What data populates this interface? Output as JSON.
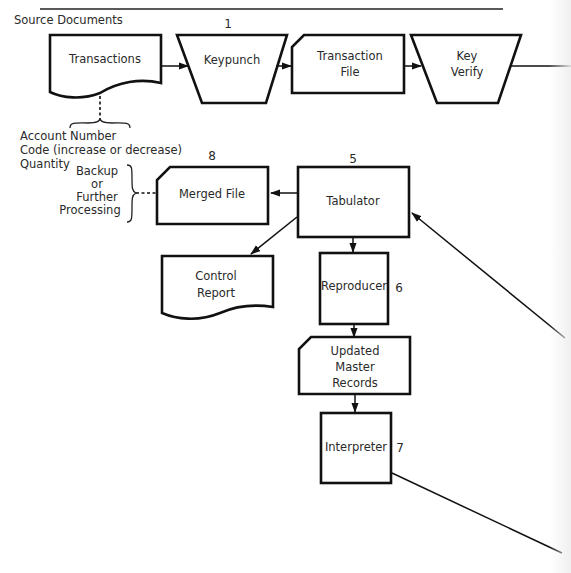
{
  "diagram": {
    "header_label": "Source Documents",
    "nodes": {
      "transactions": {
        "label": "Transactions",
        "type": "document"
      },
      "keypunch": {
        "label": "Keypunch",
        "number": "1",
        "type": "manual-operation"
      },
      "transaction_file": {
        "line1": "Transaction",
        "line2": "File",
        "type": "punched-card"
      },
      "key_verify": {
        "line1": "Key",
        "line2": "Verify",
        "type": "manual-operation"
      },
      "tabulator": {
        "label": "Tabulator",
        "number": "5",
        "type": "process"
      },
      "merged_file": {
        "label": "Merged File",
        "number": "8",
        "type": "punched-card"
      },
      "control_report": {
        "line1": "Control",
        "line2": "Report",
        "type": "document"
      },
      "reproducer": {
        "label": "Reproducer",
        "number": "6",
        "type": "process"
      },
      "updated_master_records": {
        "line1": "Updated",
        "line2": "Master",
        "line3": "Records",
        "type": "punched-card"
      },
      "interpreter": {
        "label": "Interpreter",
        "number": "7",
        "type": "process"
      }
    },
    "annotations": {
      "transaction_fields": [
        "Account Number",
        "Code (increase or decrease)",
        "Quantity"
      ],
      "backup_note": [
        "Backup",
        "or",
        "Further",
        "Processing"
      ]
    },
    "edges": [
      {
        "from": "Transactions",
        "to": "Keypunch"
      },
      {
        "from": "Keypunch",
        "to": "Transaction File"
      },
      {
        "from": "Transaction File",
        "to": "Key Verify"
      },
      {
        "from": "Key Verify",
        "to": "off-page right"
      },
      {
        "from": "off-page right",
        "to": "Tabulator"
      },
      {
        "from": "Tabulator",
        "to": "Merged File"
      },
      {
        "from": "Tabulator",
        "to": "Control Report"
      },
      {
        "from": "Tabulator",
        "to": "Reproducer"
      },
      {
        "from": "Reproducer",
        "to": "Updated Master Records"
      },
      {
        "from": "Updated Master Records",
        "to": "Interpreter"
      },
      {
        "from": "Interpreter",
        "to": "off-page right"
      }
    ]
  }
}
